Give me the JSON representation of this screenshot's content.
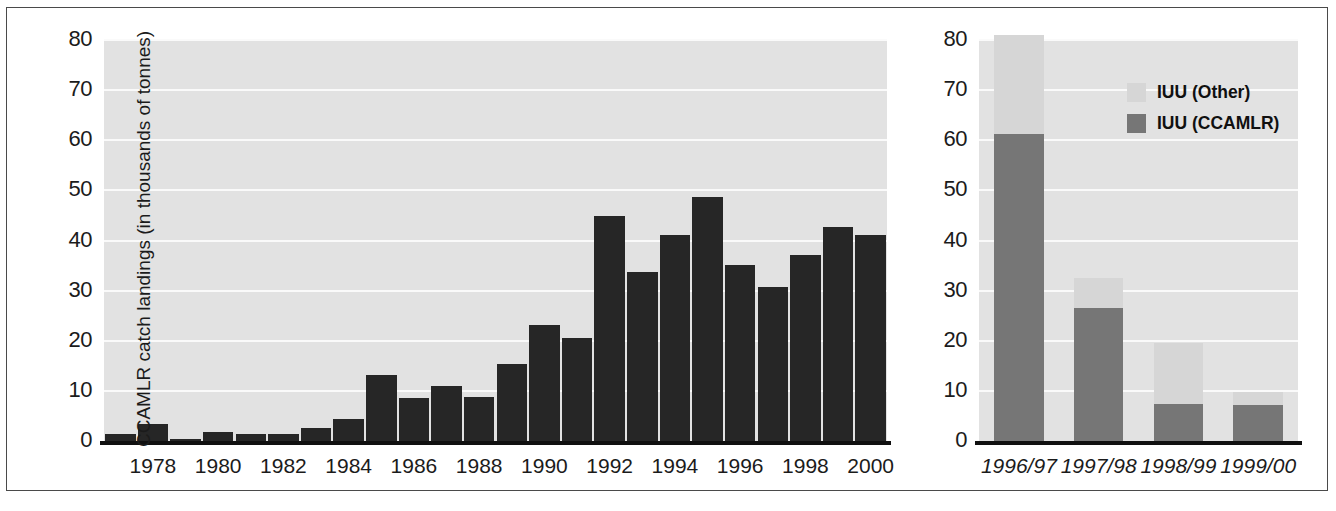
{
  "figure": {
    "width": 1336,
    "height": 511,
    "background": "#ffffff",
    "frame_color": "#4a4a4a",
    "plot_background": "#e2e2e2",
    "gridline_color": "#fafafa"
  },
  "colors": {
    "bar_dark": "#262626",
    "iuu_ccamlr": "#767676",
    "iuu_other": "#d6d6d6",
    "axis": "#101010",
    "text": "#1b1b1b"
  },
  "caption": {
    "text": ""
  },
  "chart_data": [
    {
      "type": "bar",
      "id": "reported-landings",
      "title": "",
      "xlabel": "",
      "ylabel": "CCAMLR catch landings (in thousands of tonnes)",
      "ylim": [
        0,
        80
      ],
      "yticks": [
        0,
        10,
        20,
        30,
        40,
        50,
        60,
        70,
        80
      ],
      "ytick_labels": [
        "0",
        "10",
        "20",
        "30",
        "40",
        "50",
        "60",
        "70",
        "80"
      ],
      "grid": true,
      "legend": "none",
      "categories": [
        "1977",
        "1978",
        "1979",
        "1980",
        "1981",
        "1982",
        "1983",
        "1984",
        "1985",
        "1986",
        "1987",
        "1988",
        "1989",
        "1990",
        "1991",
        "1992",
        "1993",
        "1994",
        "1995",
        "1996",
        "1997",
        "1998",
        "1999",
        "2000"
      ],
      "xtick_labels": [
        "1978",
        "1980",
        "1982",
        "1984",
        "1986",
        "1988",
        "1990",
        "1992",
        "1994",
        "1996",
        "1998",
        "2000"
      ],
      "values": [
        1.4,
        3.4,
        0.5,
        1.8,
        1.3,
        1.3,
        2.6,
        4.3,
        13.1,
        8.6,
        10.9,
        8.7,
        15.3,
        23.2,
        20.5,
        44.9,
        33.7,
        41.2,
        48.7,
        35.1,
        30.8,
        37.1,
        42.7,
        41.2
      ]
    },
    {
      "type": "bar",
      "id": "iuu-estimates",
      "subtype": "stacked",
      "title": "",
      "xlabel": "",
      "ylabel": "",
      "ylim": [
        0,
        80
      ],
      "yticks": [
        0,
        10,
        20,
        30,
        40,
        50,
        60,
        70,
        80
      ],
      "ytick_labels": [
        "0",
        "10",
        "20",
        "30",
        "40",
        "50",
        "60",
        "70",
        "80"
      ],
      "grid": true,
      "legend_position": "upper-right",
      "categories": [
        "1996/97",
        "1997/98",
        "1998/99",
        "1999/00"
      ],
      "series": [
        {
          "name": "IUU (CCAMLR)",
          "color": "#767676",
          "values": [
            61.3,
            26.5,
            7.4,
            7.2
          ]
        },
        {
          "name": "IUU (Other)",
          "color": "#d6d6d6",
          "values": [
            19.7,
            6.0,
            12.1,
            2.6
          ]
        }
      ],
      "totals": [
        81.0,
        32.5,
        19.5,
        9.8
      ]
    }
  ],
  "legend": {
    "items": [
      {
        "label": "IUU (Other)",
        "swatch": "iuu-other-swatch"
      },
      {
        "label": "IUU (CCAMLR)",
        "swatch": "iuu-ccamlr-swatch"
      }
    ]
  }
}
